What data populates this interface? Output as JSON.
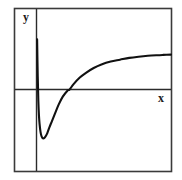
{
  "figure": {
    "kind": "function-graph",
    "background_color": "#ffffff",
    "frame_color": "#3a3a3a",
    "axis_color": "#2b2b2b",
    "curve_color": "#111111"
  },
  "labels": {
    "y_axis": "y",
    "x_axis": "x"
  },
  "chart_data": {
    "type": "line",
    "title": "",
    "subtitle": "",
    "xlabel": "x",
    "ylabel": "y",
    "legend": [],
    "legend_position": "none",
    "grid": false,
    "axes_shown": [
      "x-axis",
      "y-axis"
    ],
    "xlim": [
      -0.35,
      4.35
    ],
    "ylim": [
      -1.45,
      1.35
    ],
    "features": {
      "vertical_asymptote_x": 0,
      "minimum_point": [
        0.22,
        -0.82
      ],
      "x_intercept": [
        1.07,
        0
      ],
      "horizontal_asymptote_y": 0.59,
      "right_endpoint": [
        4.35,
        0.585
      ]
    },
    "series": [
      {
        "name": "curve",
        "color": "#111111",
        "x": [
          0.02,
          0.04,
          0.06,
          0.08,
          0.1,
          0.13,
          0.16,
          0.19,
          0.22,
          0.26,
          0.3,
          0.35,
          0.42,
          0.5,
          0.6,
          0.72,
          0.85,
          1.0,
          1.07,
          1.2,
          1.4,
          1.6,
          1.85,
          2.1,
          2.4,
          2.7,
          3.0,
          3.3,
          3.6,
          3.9,
          4.1,
          4.35
        ],
        "y": [
          0.84,
          0.22,
          -0.2,
          -0.44,
          -0.58,
          -0.71,
          -0.78,
          -0.81,
          -0.82,
          -0.81,
          -0.78,
          -0.73,
          -0.63,
          -0.53,
          -0.4,
          -0.25,
          -0.12,
          -0.02,
          0.0,
          0.09,
          0.2,
          0.28,
          0.36,
          0.42,
          0.47,
          0.5,
          0.53,
          0.55,
          0.565,
          0.575,
          0.58,
          0.585
        ]
      }
    ]
  }
}
